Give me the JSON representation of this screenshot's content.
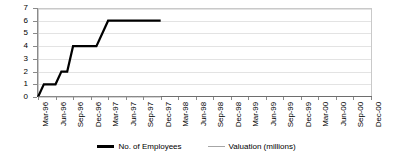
{
  "chart_data": {
    "type": "line",
    "title": "",
    "xlabel": "",
    "ylabel": "",
    "ylim": [
      0,
      7
    ],
    "y_ticks": [
      0,
      1,
      2,
      3,
      4,
      5,
      6,
      7
    ],
    "grid": true,
    "legend_position": "bottom",
    "x_tick_labels": [
      "Mar-96",
      "Jun-96",
      "Sep-96",
      "Dec-96",
      "Mar-97",
      "Jun-97",
      "Sep-97",
      "Dec-97",
      "Mar-98",
      "Jun-98",
      "Sep-98",
      "Dec-98",
      "Mar-99",
      "Jun-99",
      "Sep-99",
      "Dec-99",
      "Mar-00",
      "Jun-00",
      "Sep-00",
      "Dec-00"
    ],
    "x": [
      "Mar-96",
      "Apr-96",
      "May-96",
      "Jun-96",
      "Jul-96",
      "Aug-96",
      "Sep-96",
      "Oct-96",
      "Nov-96",
      "Dec-96",
      "Jan-97",
      "Feb-97",
      "Mar-97",
      "Apr-97",
      "May-97",
      "Jun-97",
      "Jul-97",
      "Aug-97",
      "Sep-97",
      "Oct-97",
      "Nov-97",
      "Dec-97",
      "Jan-98",
      "Feb-98",
      "Mar-98",
      "Apr-98",
      "May-98",
      "Jun-98",
      "Jul-98",
      "Aug-98",
      "Sep-98",
      "Oct-98",
      "Nov-98",
      "Dec-98",
      "Jan-99",
      "Feb-99",
      "Mar-99",
      "Apr-99",
      "May-99",
      "Jun-99",
      "Jul-99",
      "Aug-99",
      "Sep-99",
      "Oct-99",
      "Nov-99",
      "Dec-99",
      "Jan-00",
      "Feb-00",
      "Mar-00",
      "Apr-00",
      "May-00",
      "Jun-00",
      "Jul-00",
      "Aug-00",
      "Sep-00",
      "Oct-00",
      "Nov-00",
      "Dec-00"
    ],
    "series": [
      {
        "name": "No. of Employees",
        "color": "#000000",
        "line_width": 2.2,
        "values": [
          0,
          1,
          1,
          1,
          2,
          2,
          4,
          4,
          4,
          4,
          4,
          5,
          6,
          6,
          6,
          6,
          6,
          6,
          6,
          6,
          6,
          6,
          null,
          null,
          null,
          null,
          null,
          null,
          null,
          null,
          null,
          null,
          null,
          null,
          null,
          null,
          null,
          null,
          null,
          null,
          null,
          null,
          null,
          null,
          null,
          null,
          null,
          null,
          null,
          null,
          null,
          null,
          null,
          null,
          null,
          null,
          null,
          null
        ]
      },
      {
        "name": "Valuation (millions)",
        "color": "#a6a6a6",
        "line_width": 1,
        "values": [
          0,
          0,
          0,
          0,
          0,
          0,
          0,
          0,
          0,
          0,
          0,
          0,
          0,
          0,
          0,
          0,
          0,
          0,
          0,
          0,
          0,
          0,
          null,
          null,
          null,
          null,
          null,
          null,
          null,
          null,
          null,
          null,
          null,
          null,
          null,
          null,
          null,
          null,
          null,
          null,
          null,
          null,
          null,
          null,
          null,
          null,
          null,
          null,
          null,
          null,
          null,
          null,
          null,
          null,
          null,
          null,
          null,
          null
        ]
      }
    ]
  },
  "legend": {
    "items": [
      {
        "label": "No. of Employees",
        "color": "#000000",
        "weight": "thick"
      },
      {
        "label": "Valuation (millions)",
        "color": "#a6a6a6",
        "weight": "thin"
      }
    ]
  }
}
